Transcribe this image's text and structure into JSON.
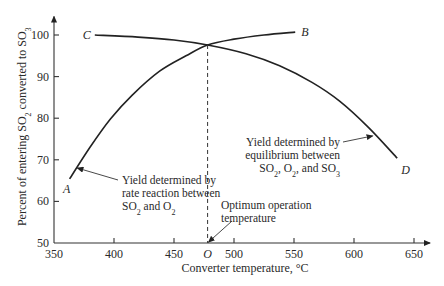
{
  "chart_data": {
    "type": "line",
    "title": "",
    "xlabel": "Converter temperature, °C",
    "ylabel_parts": [
      "Percent of entering SO",
      "2",
      " converted to SO",
      "3"
    ],
    "ylabel": "Percent of entering SO2 converted to SO3",
    "xlim": [
      350,
      655
    ],
    "ylim": [
      50,
      103
    ],
    "xticks": [
      350,
      400,
      450,
      500,
      550,
      600,
      650
    ],
    "yticks": [
      50,
      60,
      70,
      80,
      90,
      100
    ],
    "grid": false,
    "series": [
      {
        "name": "Rate-limited yield (A to B)",
        "start_label": "A",
        "end_label": "B",
        "x": [
          363,
          380,
          397,
          415,
          438,
          460,
          478,
          500,
          525,
          551
        ],
        "y": [
          65.4,
          73.0,
          79.8,
          85.5,
          91.3,
          95.0,
          97.6,
          99.0,
          100.0,
          100.7
        ]
      },
      {
        "name": "Equilibrium-limited yield (C to D)",
        "start_label": "C",
        "end_label": "D",
        "x": [
          384,
          420,
          450,
          478,
          510,
          538,
          565,
          588,
          612,
          636
        ],
        "y": [
          100.0,
          99.5,
          98.8,
          97.6,
          95.5,
          92.6,
          88.6,
          84.1,
          77.8,
          70.4
        ]
      }
    ],
    "optimum": {
      "label": "O",
      "x": 478,
      "y": 97.6
    },
    "annotations": [
      {
        "name": "rate-annotation",
        "lines": [
          "Yield determined by",
          "rate reaction between",
          "SO|2| and O|2|"
        ],
        "points_to": {
          "x": 367,
          "y": 68.5
        }
      },
      {
        "name": "equilibrium-annotation",
        "lines": [
          "Yield determined by",
          "equilibrium between",
          "SO|2|, O|2|, and SO|3|"
        ],
        "points_to": {
          "x": 618,
          "y": 75.5
        }
      },
      {
        "name": "optimum-annotation",
        "lines": [
          "Optimum operation",
          "temperature"
        ],
        "points_to": {
          "x": 478,
          "y": 50
        }
      }
    ]
  }
}
